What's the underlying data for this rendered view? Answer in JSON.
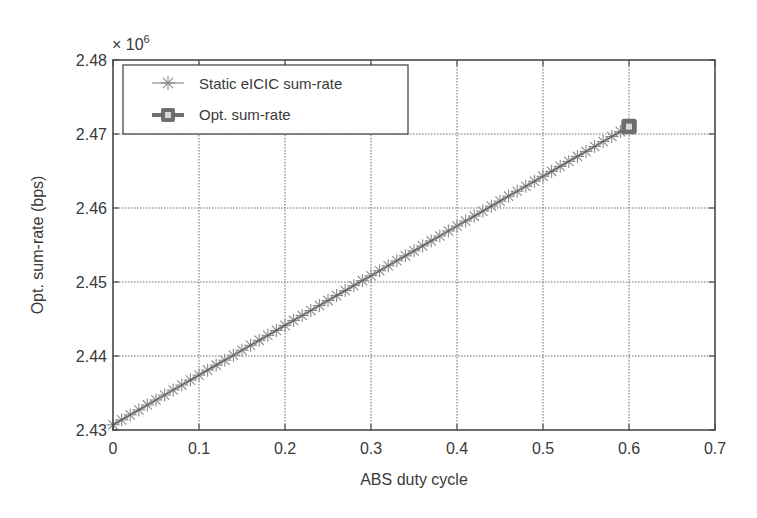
{
  "chart_data": {
    "type": "line",
    "title": "",
    "xlabel": "ABS duty cycle",
    "ylabel": "Opt. sum-rate (bps)",
    "y_multiplier_label": "× 10",
    "y_multiplier_exponent": "6",
    "xlim": [
      0,
      0.7
    ],
    "ylim": [
      2.43,
      2.48
    ],
    "x_ticks": [
      0,
      0.1,
      0.2,
      0.3,
      0.4,
      0.5,
      0.6,
      0.7
    ],
    "x_tick_labels": [
      "0",
      "0.1",
      "0.2",
      "0.3",
      "0.4",
      "0.5",
      "0.6",
      "0.7"
    ],
    "y_ticks": [
      2.43,
      2.44,
      2.45,
      2.46,
      2.47,
      2.48
    ],
    "y_tick_labels": [
      "2.43",
      "2.44",
      "2.45",
      "2.46",
      "2.47",
      "2.48"
    ],
    "grid": true,
    "legend_position": "upper left",
    "series": [
      {
        "name": "Static eICIC sum-rate",
        "marker": "asterisk",
        "color": "#8a8a8a",
        "x_start": 0,
        "x_end": 0.6,
        "x_step": 0.01,
        "y_start": 2.4307,
        "y_end": 2.471,
        "description": "Linear increase, ~61 points from x=0 to x=0.6"
      },
      {
        "name": "Opt. sum-rate",
        "marker": "square",
        "color": "#6e6e6e",
        "x": [
          0.6
        ],
        "y": [
          2.471
        ]
      }
    ]
  },
  "colors": {
    "axis": "#4a4a4a",
    "grid": "#6a6a6a",
    "static_series": "#8a8a8a",
    "static_line": "#5a5a5a",
    "opt_marker": "#6e6e6e",
    "text": "#3a3a3a"
  },
  "legend": {
    "items": [
      {
        "label": "Static eICIC sum-rate"
      },
      {
        "label": "Opt. sum-rate"
      }
    ]
  }
}
